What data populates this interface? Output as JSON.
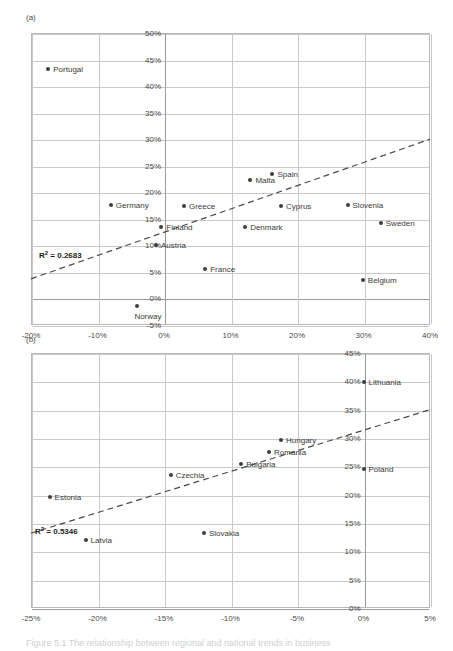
{
  "figure": {
    "caption": "Figure 5.1 The relationship between regional and national trends in business"
  },
  "chart_data": [
    {
      "id": "a",
      "panel_label": "(a)",
      "type": "scatter",
      "title": "",
      "xlabel": "",
      "ylabel": "",
      "xlim": [
        -20,
        40
      ],
      "ylim": [
        -5,
        50
      ],
      "xticks": [
        "-20%",
        "-10%",
        "0%",
        "10%",
        "20%",
        "30%",
        "40%"
      ],
      "xtick_values": [
        -20,
        -10,
        0,
        10,
        20,
        30,
        40
      ],
      "yticks": [
        "-5%",
        "0%",
        "5%",
        "10%",
        "15%",
        "20%",
        "25%",
        "30%",
        "35%",
        "40%",
        "45%",
        "50%"
      ],
      "ytick_values": [
        -5,
        0,
        5,
        10,
        15,
        20,
        25,
        30,
        35,
        40,
        45,
        50
      ],
      "grid": true,
      "annotation": "R² = 0.2683",
      "r2_value": "0.2683",
      "trendline": {
        "x1": -20,
        "y1": 3.7,
        "x2": 40,
        "y2": 30.0
      },
      "points": [
        {
          "label": "Portugal",
          "x": -17.4,
          "y": 43.3,
          "label_pos": "right"
        },
        {
          "label": "Germany",
          "x": -8.0,
          "y": 17.6,
          "label_pos": "right"
        },
        {
          "label": "Greece",
          "x": 3.0,
          "y": 17.4,
          "label_pos": "right"
        },
        {
          "label": "Cyprus",
          "x": 17.6,
          "y": 17.5,
          "label_pos": "right"
        },
        {
          "label": "Slovenia",
          "x": 27.6,
          "y": 17.6,
          "label_pos": "right"
        },
        {
          "label": "Sweden",
          "x": 32.6,
          "y": 14.3,
          "label_pos": "right"
        },
        {
          "label": "Finland",
          "x": -0.4,
          "y": 13.4,
          "label_pos": "right"
        },
        {
          "label": "Denmark",
          "x": 12.2,
          "y": 13.4,
          "label_pos": "right"
        },
        {
          "label": "Austria",
          "x": -1.2,
          "y": 10.1,
          "label_pos": "right"
        },
        {
          "label": "France",
          "x": 6.2,
          "y": 5.5,
          "label_pos": "right"
        },
        {
          "label": "Belgium",
          "x": 29.9,
          "y": 3.4,
          "label_pos": "right"
        },
        {
          "label": "Malta",
          "x": 13.0,
          "y": 22.4,
          "label_pos": "right"
        },
        {
          "label": "Spain",
          "x": 16.3,
          "y": 23.4,
          "label_pos": "right"
        },
        {
          "label": "Norway",
          "x": -4.0,
          "y": -1.5,
          "label_pos": "below"
        }
      ]
    },
    {
      "id": "b",
      "panel_label": "(b)",
      "type": "scatter",
      "title": "",
      "xlabel": "",
      "ylabel": "",
      "xlim": [
        -25,
        5
      ],
      "ylim": [
        0,
        45
      ],
      "xticks": [
        "-25%",
        "-20%",
        "-15%",
        "-10%",
        "-5%",
        "0%",
        "5%"
      ],
      "xtick_values": [
        -25,
        -20,
        -15,
        -10,
        -5,
        0,
        5
      ],
      "yticks": [
        "0%",
        "5%",
        "10%",
        "15%",
        "20%",
        "25%",
        "30%",
        "35%",
        "40%",
        "45%"
      ],
      "ytick_values": [
        0,
        5,
        10,
        15,
        20,
        25,
        30,
        35,
        40,
        45
      ],
      "grid": true,
      "annotation": "R² = 0.5346",
      "r2_value": "0.5346",
      "trendline": {
        "x1": -25,
        "y1": 13.2,
        "x2": 5,
        "y2": 35.0
      },
      "points": [
        {
          "label": "Lithuania",
          "x": 0.0,
          "y": 39.8,
          "label_pos": "right"
        },
        {
          "label": "Hungary",
          "x": -6.2,
          "y": 29.7,
          "label_pos": "right"
        },
        {
          "label": "Romania",
          "x": -7.1,
          "y": 27.6,
          "label_pos": "right"
        },
        {
          "label": "Bulgaria",
          "x": -9.2,
          "y": 25.5,
          "label_pos": "right"
        },
        {
          "label": "Poland",
          "x": 0.0,
          "y": 24.5,
          "label_pos": "right"
        },
        {
          "label": "Czechia",
          "x": -14.5,
          "y": 23.5,
          "label_pos": "right"
        },
        {
          "label": "Estonia",
          "x": -23.6,
          "y": 19.6,
          "label_pos": "right"
        },
        {
          "label": "Slovakia",
          "x": -12.0,
          "y": 13.3,
          "label_pos": "right"
        },
        {
          "label": "Latvia",
          "x": -20.9,
          "y": 12.0,
          "label_pos": "right"
        }
      ]
    }
  ]
}
